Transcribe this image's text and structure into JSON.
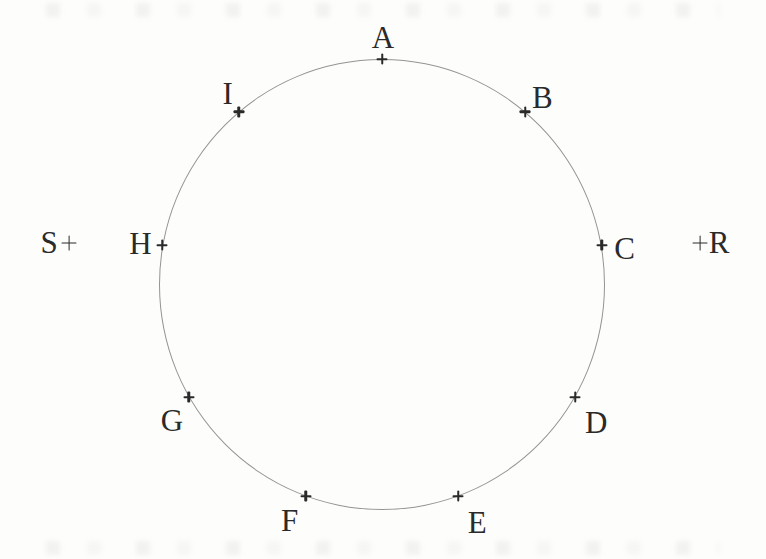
{
  "diagram": {
    "type": "geometry-figure",
    "background_color": "#fdfdfc",
    "ink_color": "#2a2a2a",
    "circle": {
      "cx": 382,
      "cy": 284.5,
      "rx": 223,
      "ry": 225.5,
      "stroke_color": "#949494",
      "stroke_width": 1.4
    },
    "points_on_circle": [
      {
        "label": "A",
        "angle_deg": 0,
        "label_dx": 1,
        "label_dy": -22
      },
      {
        "label": "B",
        "angle_deg": 40,
        "label_dx": 17,
        "label_dy": -15
      },
      {
        "label": "C",
        "angle_deg": 80,
        "label_dx": 23,
        "label_dy": 3
      },
      {
        "label": "D",
        "angle_deg": 120,
        "label_dx": 21,
        "label_dy": 25
      },
      {
        "label": "E",
        "angle_deg": 160,
        "label_dx": 19,
        "label_dy": 26
      },
      {
        "label": "F",
        "angle_deg": 200,
        "label_dx": -16,
        "label_dy": 24
      },
      {
        "label": "G",
        "angle_deg": 240,
        "label_dx": -17,
        "label_dy": 23
      },
      {
        "label": "H",
        "angle_deg": 280,
        "label_dx": -22,
        "label_dy": -2
      },
      {
        "label": "I",
        "angle_deg": 320,
        "label_dx": -11,
        "label_dy": -19
      }
    ],
    "external_points": [
      {
        "label": "S",
        "x": 69,
        "y": 243,
        "label_dx": -20,
        "label_dy": -1
      },
      {
        "label": "R",
        "x": 700,
        "y": 243,
        "label_dx": 19,
        "label_dy": -1
      }
    ]
  }
}
